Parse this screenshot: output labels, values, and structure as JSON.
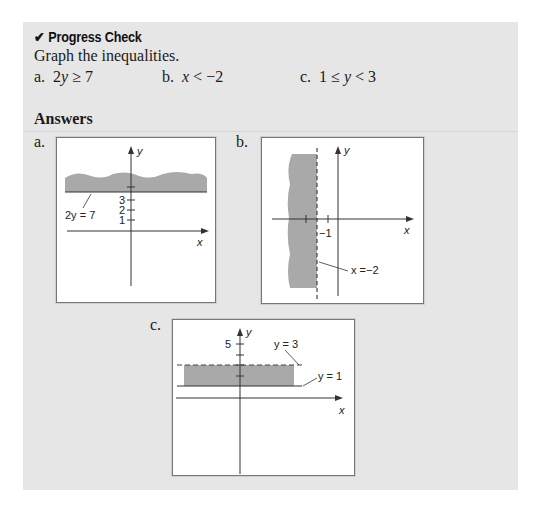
{
  "header": {
    "check_icon": "✔",
    "title": "Progress Check"
  },
  "instruction": "Graph the inequalities.",
  "problems": [
    {
      "label": "a.",
      "expr_pre": "2",
      "expr_var": "y",
      "expr_post": " ≥ 7"
    },
    {
      "label": "b.",
      "expr_pre": "",
      "expr_var": "x",
      "expr_post": " < −2"
    },
    {
      "label": "c.",
      "expr_pre": "1 ≤ ",
      "expr_var": "y",
      "expr_post": " < 3"
    }
  ],
  "answers_heading": "Answers",
  "graphs": {
    "a": {
      "label": "a.",
      "x_axis": "x",
      "y_axis": "y",
      "ticks": [
        "3",
        "2",
        "1"
      ],
      "boundary_label": "2y = 7",
      "boundary_style": "solid",
      "shade": "above"
    },
    "b": {
      "label": "b.",
      "x_axis": "x",
      "y_axis": "y",
      "ticks": [
        "−1"
      ],
      "boundary_label": "x =−2",
      "boundary_style": "dashed",
      "shade": "left"
    },
    "c": {
      "label": "c.",
      "x_axis": "x",
      "y_axis": "y",
      "ticks": [
        "5"
      ],
      "upper_label": "y = 3",
      "upper_style": "dashed",
      "lower_label": "y = 1",
      "lower_style": "solid",
      "shade": "between"
    }
  },
  "colors": {
    "panel_bg": "#e6e6e6",
    "shade": "#a9a9a9",
    "axis": "#333333"
  }
}
